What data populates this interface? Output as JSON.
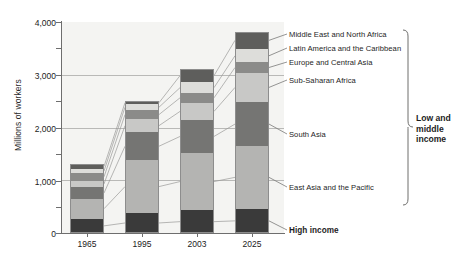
{
  "chart_data": {
    "type": "bar",
    "subtype": "stacked-bar",
    "title": "",
    "xlabel": "",
    "ylabel": "Millions of workers",
    "categories": [
      "1965",
      "1995",
      "2003",
      "2025"
    ],
    "ylim": [
      0,
      4000
    ],
    "yticks": [
      0,
      500,
      1000,
      1500,
      2000,
      2500,
      3000,
      3500,
      4000
    ],
    "yticklabels": [
      "0",
      "",
      "1,000",
      "",
      "2,000",
      "",
      "3,000",
      "",
      "4,000"
    ],
    "gridlines": [
      "1000",
      "2000",
      "3000"
    ],
    "grid": true,
    "legend_position": "right-leader-lines",
    "series": [
      {
        "name": "High income",
        "color": "#3a3a3a",
        "values": [
          270,
          380,
          430,
          460
        ]
      },
      {
        "name": "East Asia and the Pacific",
        "color": "#b4b4b2",
        "values": [
          380,
          1000,
          1090,
          1190
        ]
      },
      {
        "name": "South Asia",
        "color": "#757573",
        "values": [
          215,
          530,
          620,
          830
        ]
      },
      {
        "name": "Sub-Saharan Africa",
        "color": "#c8c8c6",
        "values": [
          130,
          250,
          330,
          560
        ]
      },
      {
        "name": "Europe and Central Asia",
        "color": "#8b8b89",
        "values": [
          140,
          170,
          185,
          195
        ]
      },
      {
        "name": "Latin America and the Caribbean",
        "color": "#ddddda",
        "values": [
          80,
          110,
          200,
          250
        ]
      },
      {
        "name": "Middle East and North Africa",
        "color": "#5e5e5c",
        "values": [
          95,
          60,
          255,
          335
        ]
      }
    ],
    "totals": [
      1310,
      2500,
      3110,
      3820
    ],
    "annotations": [
      {
        "text": "High income",
        "style": "bold"
      },
      {
        "text": "Low and middle income",
        "style": "bracket-bold"
      }
    ]
  },
  "legend": {
    "items": [
      "Middle East and North Africa",
      "Latin America and the Caribbean",
      "Europe and Central Asia",
      "Sub-Saharan Africa",
      "South Asia",
      "East Asia and the Pacific"
    ],
    "high_income": "High income"
  },
  "bracket": {
    "line1": "Low and",
    "line2": "middle",
    "line3": "income"
  },
  "axis": {
    "y_title": "Millions of workers",
    "y_labels": [
      "4,000",
      "3,000",
      "2,000",
      "1,000",
      "0"
    ],
    "x_labels": [
      "1965",
      "1995",
      "2003",
      "2025"
    ]
  },
  "colors": {
    "plot_bg": "#f4f4f2",
    "axis": "#6e6e6e",
    "grid": "#b9b9b7",
    "text": "#1d1d1d"
  }
}
